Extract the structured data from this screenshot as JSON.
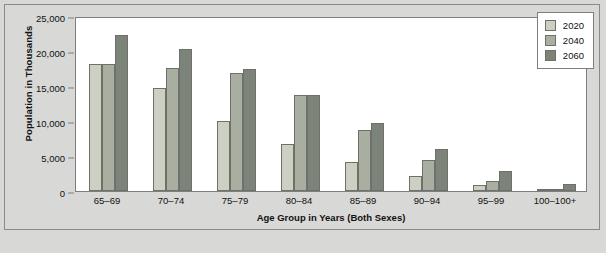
{
  "chart_data": {
    "type": "bar",
    "title": "",
    "xlabel": "Age Group in Years (Both Sexes)",
    "ylabel": "Population in Thousands",
    "categories": [
      "65–69",
      "70–74",
      "75–79",
      "80–84",
      "85–89",
      "90–94",
      "95–99",
      "100–100+"
    ],
    "series": [
      {
        "name": "2020",
        "color": "#ccd0c3",
        "values": [
          18100,
          14750,
          10050,
          6700,
          4100,
          2200,
          800,
          120
        ]
      },
      {
        "name": "2040",
        "color": "#a9afa0",
        "values": [
          18150,
          17550,
          16800,
          13700,
          8750,
          4500,
          1450,
          280
        ]
      },
      {
        "name": "2060",
        "color": "#7c8479",
        "values": [
          22350,
          20300,
          17500,
          13650,
          9750,
          6000,
          2900,
          1000
        ]
      }
    ],
    "ylim": [
      0,
      25000
    ],
    "yticks": [
      0,
      5000,
      10000,
      15000,
      20000,
      25000
    ],
    "ytick_labels": [
      "0",
      "5,000",
      "10,000",
      "15,000",
      "20,000",
      "25,000"
    ],
    "grid": false,
    "legend_position": "top-right",
    "legend_entries": [
      "2020",
      "2040",
      "2060"
    ]
  }
}
